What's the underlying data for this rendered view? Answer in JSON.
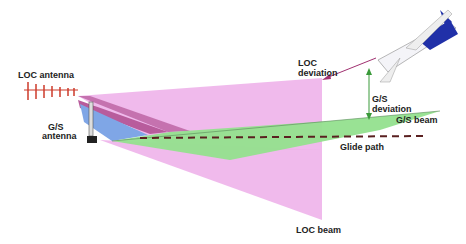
{
  "diagram": {
    "labels": {
      "loc_antenna": "LOC antenna",
      "gs_antenna_line1": "G/S",
      "gs_antenna_line2": "antenna",
      "loc_deviation_line1": "LOC",
      "loc_deviation_line2": "deviation",
      "gs_deviation_line1": "G/S",
      "gs_deviation_line2": "deviation",
      "gs_beam": "G/S beam",
      "glide_path": "Glide path",
      "loc_beam": "LOC beam"
    },
    "colors": {
      "loc_beam": "#e9a8e6",
      "loc_beam_dark": "#b45aa0",
      "gs_beam": "#8fe08a",
      "blue_wedge": "#7fa6e6",
      "glide_path": "#6b2020",
      "aircraft": "#1f2fa8",
      "loc_antenna": "#d04030",
      "deviation_arrow": "#a03070",
      "gs_deviation_arrow": "#3a9a3a"
    }
  }
}
